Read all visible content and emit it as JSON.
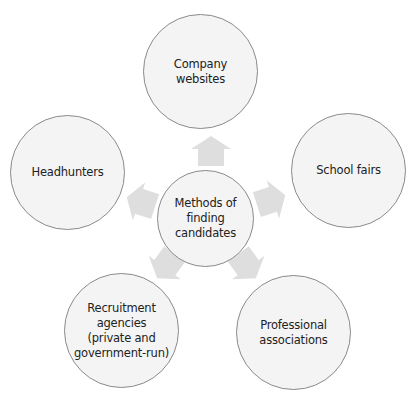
{
  "diagram": {
    "type": "hub-and-spoke",
    "center": {
      "label": "Methods of\nfinding\ncandidates"
    },
    "nodes": [
      {
        "id": "company-websites",
        "label": "Company\nwebsites",
        "position": "top"
      },
      {
        "id": "school-fairs",
        "label": "School fairs",
        "position": "right"
      },
      {
        "id": "professional-associations",
        "label": "Professional\nassociations",
        "position": "bottom-right"
      },
      {
        "id": "recruitment-agencies",
        "label": "Recruitment\nagencies\n(private and\ngovernment-run)",
        "position": "bottom-left"
      },
      {
        "id": "headhunters",
        "label": "Headhunters",
        "position": "left"
      }
    ],
    "colors": {
      "node_fill": "#f4f4f4",
      "node_border": "#8a8a8a",
      "arrow_fill": "#dedede",
      "text": "#222222"
    }
  }
}
